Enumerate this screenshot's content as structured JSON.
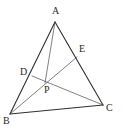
{
  "figure": {
    "canvas": {
      "width": 123,
      "height": 129,
      "background": "#ffffff"
    },
    "stroke": {
      "color": "#2f2f2f",
      "thin_color": "#4a4a4a",
      "width": 1.1,
      "thin_width": 0.7
    },
    "points": [
      {
        "id": "A",
        "label": "A",
        "x": 55,
        "y": 22,
        "label_x": 52,
        "label_y": 6,
        "on": "apex"
      },
      {
        "id": "B",
        "label": "B",
        "x": 10,
        "y": 114,
        "label_x": 3,
        "label_y": 116,
        "on": "bottom-left"
      },
      {
        "id": "C",
        "label": "C",
        "x": 103,
        "y": 105,
        "label_x": 106,
        "label_y": 103,
        "on": "bottom-right"
      },
      {
        "id": "D",
        "label": "D",
        "x": 32,
        "y": 76,
        "label_x": 20,
        "label_y": 67,
        "on": "segment-AB"
      },
      {
        "id": "E",
        "label": "E",
        "x": 77,
        "y": 57,
        "label_x": 79,
        "label_y": 44,
        "on": "segment-AC"
      },
      {
        "id": "P",
        "label": "P",
        "x": 45,
        "y": 83,
        "label_x": 44,
        "label_y": 85,
        "on": "interior"
      }
    ],
    "segments": [
      {
        "name": "side-AB",
        "from": "A",
        "to": "B",
        "weight": "thick"
      },
      {
        "name": "side-AC",
        "from": "A",
        "to": "C",
        "weight": "thick"
      },
      {
        "name": "side-BC",
        "from": "B",
        "to": "C",
        "weight": "thick"
      },
      {
        "name": "cevian-AP",
        "from": "A",
        "to": "P",
        "weight": "thin"
      },
      {
        "name": "cevian-DC",
        "from": "D",
        "to": "C",
        "weight": "thin"
      },
      {
        "name": "cevian-BE",
        "from": "B",
        "to": "E",
        "weight": "thin"
      }
    ]
  }
}
